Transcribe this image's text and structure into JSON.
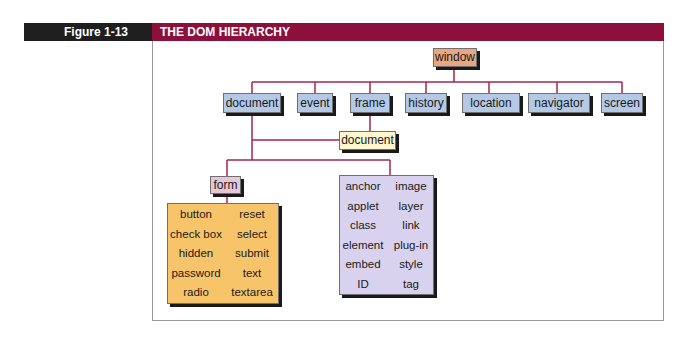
{
  "header": {
    "figure_label": "Figure 1-13",
    "title": "THE DOM HIERARCHY"
  },
  "colors": {
    "header_dark": "#1f1f1f",
    "header_accent": "#8c0f3c",
    "connector": "#a3244f",
    "window_node": "#e8a783",
    "window_children": "#b3c9e6",
    "frame_document": "#fdf6cf",
    "form_node": "#e5c7d8",
    "form_elements": "#f7c46a",
    "document_objects": "#d9d2ee"
  },
  "diagram": {
    "root": "window",
    "window_children": [
      "document",
      "event",
      "frame",
      "history",
      "location",
      "navigator",
      "screen"
    ],
    "frame_child": "document",
    "form": "form",
    "form_elements": [
      [
        "button",
        "reset"
      ],
      [
        "check box",
        "select"
      ],
      [
        "hidden",
        "submit"
      ],
      [
        "password",
        "text"
      ],
      [
        "radio",
        "textarea"
      ]
    ],
    "document_objects": [
      [
        "anchor",
        "image"
      ],
      [
        "applet",
        "layer"
      ],
      [
        "class",
        "link"
      ],
      [
        "element",
        "plug-in"
      ],
      [
        "embed",
        "style"
      ],
      [
        "ID",
        "tag"
      ]
    ]
  }
}
